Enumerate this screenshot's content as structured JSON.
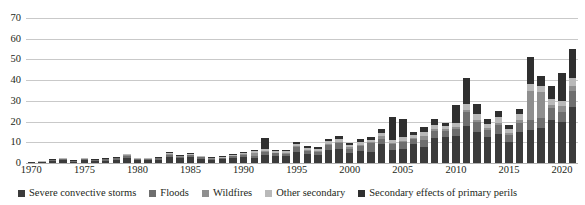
{
  "chart_data": {
    "type": "bar",
    "title": "",
    "subtitle": "",
    "xlabel": "",
    "ylabel": "",
    "stacked": true,
    "grid": true,
    "legend_position": "bottom",
    "ylim": [
      0,
      70
    ],
    "ytick_labels": [
      "0",
      "10",
      "20",
      "30",
      "40",
      "50",
      "60",
      "70"
    ],
    "ytick_values": [
      0,
      10,
      20,
      30,
      40,
      50,
      60,
      70
    ],
    "xtick_labels": [
      "1970",
      "1975",
      "1980",
      "1985",
      "1990",
      "1995",
      "2000",
      "2005",
      "2010",
      "2015",
      "2020"
    ],
    "categories": [
      "1970",
      "1971",
      "1972",
      "1973",
      "1974",
      "1975",
      "1976",
      "1977",
      "1978",
      "1979",
      "1980",
      "1981",
      "1982",
      "1983",
      "1984",
      "1985",
      "1986",
      "1987",
      "1988",
      "1989",
      "1990",
      "1991",
      "1992",
      "1993",
      "1994",
      "1995",
      "1996",
      "1997",
      "1998",
      "1999",
      "2000",
      "2001",
      "2002",
      "2003",
      "2004",
      "2005",
      "2006",
      "2007",
      "2008",
      "2009",
      "2010",
      "2011",
      "2012",
      "2013",
      "2014",
      "2015",
      "2016",
      "2017",
      "2018",
      "2019",
      "2020",
      "2021"
    ],
    "series": [
      {
        "name": "Severe convective storms",
        "color": "#3b3b3b",
        "values": [
          0.4,
          0.5,
          1.0,
          1.3,
          0.6,
          1.4,
          1.0,
          1.2,
          1.6,
          2.6,
          1.5,
          1.4,
          1.6,
          3.0,
          2.2,
          2.8,
          2.0,
          1.4,
          1.7,
          2.4,
          3.0,
          2.5,
          4.0,
          3.3,
          3.2,
          5.5,
          4.3,
          4.0,
          6.5,
          7.0,
          5.0,
          6.0,
          5.5,
          9.0,
          6.5,
          7.0,
          9.0,
          7.5,
          12.0,
          12.5,
          13.0,
          18.0,
          15.0,
          12.5,
          14.0,
          10.0,
          15.0,
          16.0,
          17.0,
          21.0,
          20.0,
          27.0
        ]
      },
      {
        "name": "Floods",
        "color": "#6e6e6e",
        "values": [
          0.1,
          0.2,
          0.4,
          0.5,
          0.3,
          0.5,
          0.4,
          0.5,
          0.6,
          0.9,
          0.5,
          0.5,
          0.6,
          1.0,
          0.8,
          1.0,
          0.7,
          0.6,
          0.6,
          0.9,
          1.0,
          1.0,
          1.5,
          1.3,
          1.2,
          2.0,
          1.6,
          1.5,
          2.2,
          2.5,
          2.0,
          2.2,
          4.0,
          2.5,
          2.5,
          3.0,
          2.5,
          3.5,
          3.5,
          3.0,
          3.5,
          6.5,
          5.0,
          3.5,
          4.5,
          3.5,
          4.5,
          5.0,
          4.5,
          5.5,
          4.5,
          8.0
        ]
      },
      {
        "name": "Wildfires",
        "color": "#8f8f8f",
        "values": [
          0.0,
          0.0,
          0.1,
          0.1,
          0.1,
          0.1,
          0.1,
          0.1,
          0.1,
          0.2,
          0.1,
          0.1,
          0.1,
          0.2,
          0.2,
          0.2,
          0.2,
          0.2,
          0.3,
          0.3,
          0.4,
          1.5,
          0.5,
          0.4,
          0.5,
          0.5,
          0.5,
          0.5,
          0.6,
          0.7,
          0.5,
          0.6,
          0.6,
          1.5,
          0.6,
          0.8,
          0.7,
          2.0,
          0.8,
          0.7,
          0.8,
          1.0,
          1.0,
          0.8,
          1.0,
          1.0,
          1.5,
          14.0,
          13.0,
          1.5,
          3.0,
          2.0
        ]
      },
      {
        "name": "Other secondary",
        "color": "#b9b9b9",
        "values": [
          0.1,
          0.1,
          0.2,
          0.3,
          0.2,
          0.3,
          0.2,
          0.3,
          0.3,
          0.5,
          0.3,
          0.3,
          0.3,
          0.6,
          0.4,
          0.6,
          0.4,
          0.3,
          0.4,
          0.5,
          0.6,
          0.6,
          0.8,
          0.7,
          0.7,
          1.0,
          0.9,
          0.8,
          1.2,
          1.3,
          1.0,
          1.2,
          1.2,
          1.5,
          1.4,
          1.6,
          1.4,
          1.8,
          2.0,
          1.8,
          2.0,
          3.0,
          2.5,
          2.0,
          2.5,
          2.0,
          2.5,
          3.0,
          2.5,
          3.0,
          2.5,
          4.0
        ]
      },
      {
        "name": "Secondary effects of primary perils",
        "color": "#2f2f2f",
        "values": [
          0.0,
          0.0,
          0.1,
          0.2,
          0.1,
          0.2,
          0.1,
          0.2,
          0.2,
          0.4,
          0.2,
          0.2,
          0.2,
          0.5,
          0.3,
          0.4,
          0.3,
          0.2,
          0.3,
          0.5,
          0.5,
          0.6,
          5.5,
          0.6,
          0.7,
          1.0,
          0.8,
          0.8,
          1.3,
          1.5,
          1.0,
          1.5,
          1.2,
          2.0,
          11.0,
          9.0,
          1.5,
          2.5,
          3.0,
          1.5,
          8.5,
          12.5,
          5.0,
          2.5,
          3.0,
          2.0,
          2.5,
          13.0,
          5.0,
          6.0,
          13.5,
          14.0
        ]
      }
    ]
  },
  "legend": {
    "items": [
      {
        "label": "Severe convective storms",
        "color": "#3b3b3b"
      },
      {
        "label": "Floods",
        "color": "#6e6e6e"
      },
      {
        "label": "Wildfires",
        "color": "#8f8f8f"
      },
      {
        "label": "Other secondary",
        "color": "#b9b9b9"
      },
      {
        "label": "Secondary effects of primary perils",
        "color": "#2f2f2f"
      }
    ]
  }
}
